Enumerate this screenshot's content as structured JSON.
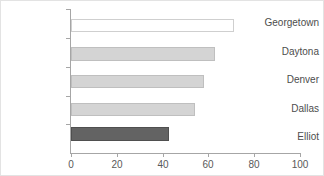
{
  "chart_data": {
    "type": "bar",
    "orientation": "horizontal",
    "title": "",
    "xlabel": "",
    "ylabel": "",
    "categories": [
      "Georgetown",
      "Daytona",
      "Denver",
      "Dallas",
      "Elliot"
    ],
    "values": [
      71,
      63,
      58,
      54,
      43
    ],
    "xlim": [
      0,
      100
    ],
    "xticks": [
      0,
      20,
      40,
      60,
      80,
      100
    ],
    "xtick_labels": [
      "0",
      "20",
      "40",
      "60",
      "80",
      "100"
    ],
    "grid": false,
    "legend": false,
    "bar_styles": [
      "outline",
      "light",
      "light",
      "light",
      "dark"
    ],
    "colors": {
      "bar_outline_fill": "#ffffff",
      "bar_outline_border": "#cfcfcf",
      "bar_light_fill": "#d4d4d4",
      "bar_light_border": "#bfbfbf",
      "bar_dark_fill": "#636363",
      "bar_dark_border": "#4f4f4f",
      "axis": "#a6a6a6",
      "tick_text": "#595959",
      "category_text": "#4d4d4d",
      "frame": "#e3e3e3",
      "background": "#ffffff"
    }
  }
}
